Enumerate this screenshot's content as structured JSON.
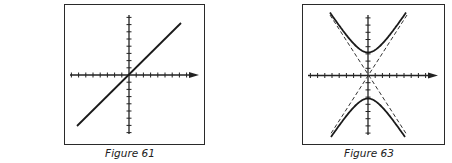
{
  "figures": [
    {
      "id": "figure-61",
      "caption": "Figure 61",
      "description": "Straight line through the origin (y = x) on Cartesian axes with tick marks",
      "frame": {
        "x": 64,
        "y": 4,
        "w": 141,
        "h": 141
      },
      "origin": {
        "x": 129,
        "y": 75
      },
      "x_axis": {
        "from": 70,
        "to": 199,
        "ticks_left": 8,
        "ticks_right": 9,
        "tick_spacing": 7.2
      },
      "y_axis": {
        "from": 15,
        "to": 134,
        "ticks_up": 8,
        "ticks_down": 8,
        "tick_spacing": 7.2
      },
      "curve": {
        "type": "line",
        "equation": "y = x",
        "from": [
          77,
          126
        ],
        "to": [
          181,
          23
        ]
      }
    },
    {
      "id": "figure-63",
      "caption": "Figure 63",
      "description": "Hyperbola opening up and down (y^2 - x^2 = a^2) with dashed asymptotes through origin",
      "frame": {
        "x": 302,
        "y": 4,
        "w": 143,
        "h": 141
      },
      "origin": {
        "x": 368,
        "y": 75.5
      },
      "x_axis": {
        "from": 308,
        "to": 438,
        "ticks_left": 8,
        "ticks_right": 9,
        "tick_spacing": 7.2
      },
      "y_axis": {
        "from": 15,
        "to": 135,
        "ticks_up": 8,
        "ticks_down": 8,
        "tick_spacing": 7.2
      },
      "curve": {
        "type": "hyperbola",
        "equation": "y^2 - x^2 = a^2",
        "vertex_offset_px": 23,
        "asymptote_slope": 1.54,
        "half_width_px": 40
      },
      "asymptotes": {
        "style": "dashed",
        "lines": [
          [
            [
              330,
              15
            ],
            [
              407,
              135
            ]
          ],
          [
            [
              407,
              15
            ],
            [
              330,
              135
            ]
          ]
        ]
      }
    }
  ]
}
